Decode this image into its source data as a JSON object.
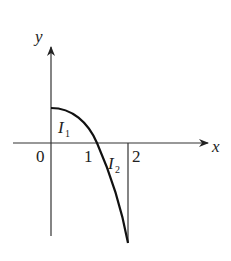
{
  "diagram": {
    "axes": {
      "x_label": "x",
      "y_label": "y",
      "origin_label": "0",
      "tick_labels": [
        "1",
        "2"
      ]
    },
    "regions": [
      {
        "name": "I",
        "subscript": "1",
        "description": "area between curve and x-axis on [0,1], above axis"
      },
      {
        "name": "I",
        "subscript": "2",
        "description": "area between curve and x-axis on [1,2], below axis"
      }
    ],
    "curve": {
      "description": "concave-down curve starting on positive y-axis, crossing x-axis at x=1, descending steeply to x=2",
      "color": "#111111"
    },
    "line_color": "#333333"
  }
}
